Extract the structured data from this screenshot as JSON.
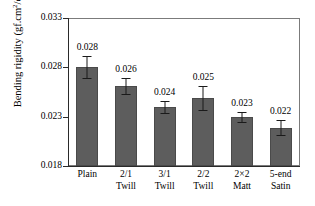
{
  "chart_data": {
    "type": "bar",
    "title": "",
    "xlabel": "",
    "ylabel": "Bending rigidity (gf.cm2/cm)",
    "ylabel_prefix": "Bending rigidity (gf.cm",
    "ylabel_sup": "2",
    "ylabel_suffix": "/cm)",
    "categories": [
      "Plain",
      "2/1 Twill",
      "3/1 Twill",
      "2/2 Twill",
      "2×2 Matt",
      "5-end Satin"
    ],
    "category_lines": [
      [
        "Plain",
        ""
      ],
      [
        "2/1",
        "Twill"
      ],
      [
        "3/1",
        "Twill"
      ],
      [
        "2/2",
        "Twill"
      ],
      [
        "2×2",
        "Matt"
      ],
      [
        "5-end",
        "Satin"
      ]
    ],
    "values": [
      0.028,
      0.0261,
      0.024,
      0.0249,
      0.023,
      0.0219
    ],
    "errors": [
      0.0011,
      0.0008,
      0.0006,
      0.0012,
      0.0005,
      0.0008
    ],
    "data_labels": [
      "0.028",
      "0.026",
      "0.024",
      "0.025",
      "0.023",
      "0.022"
    ],
    "ylim": [
      0.018,
      0.033
    ],
    "yticks": [
      0.018,
      0.023,
      0.028,
      0.033
    ],
    "ytick_labels": [
      "0.018",
      "0.023",
      "0.028",
      "0.033"
    ],
    "grid": false,
    "legend": false,
    "bar_color": "#5d5d5d",
    "axis_color": "#2a2a2a",
    "frame_color": "#7b7b7b",
    "background": "#ffffff"
  }
}
